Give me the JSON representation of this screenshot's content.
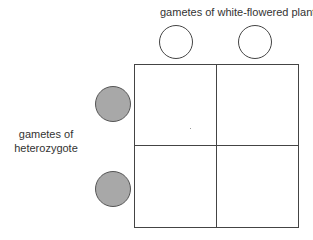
{
  "top_label": "gametes of  white-flowered plant",
  "side_label": {
    "line1": "gametes of",
    "line2": "heterozygote"
  },
  "top_gametes": [
    {
      "fill": "#ffffff",
      "type": "white"
    },
    {
      "fill": "#ffffff",
      "type": "white"
    }
  ],
  "side_gametes": [
    {
      "fill": "#a8a8a8",
      "type": "grey"
    },
    {
      "fill": "#a8a8a8",
      "type": "grey"
    }
  ],
  "punnett_square": {
    "rows": 2,
    "cols": 2,
    "cells": [
      [
        "",
        ""
      ],
      [
        "",
        ""
      ]
    ]
  }
}
